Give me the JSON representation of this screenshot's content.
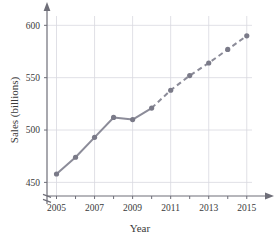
{
  "chart_data": {
    "type": "line",
    "title": "",
    "xlabel": "Year",
    "ylabel": "Sales (billions)",
    "x": [
      2005,
      2006,
      2007,
      2008,
      2009,
      2010,
      2011,
      2012,
      2013,
      2014,
      2015
    ],
    "values": [
      458,
      474,
      493,
      512,
      510,
      521,
      538,
      552,
      564,
      577,
      590
    ],
    "series": [
      {
        "name": "Sales (billions)",
        "x": [
          2005,
          2006,
          2007,
          2008,
          2009,
          2010,
          2011,
          2012,
          2013,
          2014,
          2015
        ],
        "values": [
          458,
          474,
          493,
          512,
          510,
          521,
          538,
          552,
          564,
          577,
          590
        ],
        "solid_through": 2010,
        "dashed_from": 2010
      }
    ],
    "xlim": [
      2004.5,
      2015.8
    ],
    "ylim": [
      437,
      607
    ],
    "y_ticks": [
      450,
      500,
      550,
      600
    ],
    "y_tick_labels": [
      "450",
      "500",
      "550",
      "600"
    ],
    "x_ticks": [
      2005,
      2006,
      2007,
      2008,
      2009,
      2010,
      2011,
      2012,
      2013,
      2014,
      2015
    ],
    "x_tick_labels": [
      "2005",
      "",
      "2007",
      "",
      "2009",
      "",
      "2011",
      "",
      "2013",
      "",
      "2015"
    ],
    "x_labeled_ticks": [
      2005,
      2007,
      2009,
      2011,
      2013,
      2015
    ],
    "grid": true,
    "legend": "none",
    "axis_break": true,
    "line_color": "#8c8c99",
    "marker_color": "#7a7a88",
    "grid_color": "#d8d8e0",
    "axis_color": "#6e6e78"
  }
}
